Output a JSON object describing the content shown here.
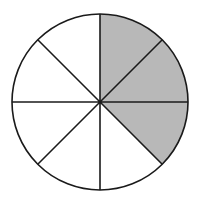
{
  "figure": {
    "background_color": "#ffffff"
  },
  "chart_data": {
    "type": "pie",
    "title": "",
    "subtitle": "",
    "xlabel": "",
    "ylabel": "",
    "legend": [],
    "annotations": [],
    "grid": false,
    "total_sectors": 8,
    "sector_angle_degrees": 45,
    "shaded_sectors": 3,
    "unshaded_sectors": 5,
    "fraction_shaded": "3/8",
    "fraction_unshaded": "5/8",
    "categories": [
      "shaded",
      "unshaded"
    ],
    "values": [
      3,
      5
    ],
    "colors": {
      "shaded": "#b8b8b8",
      "unshaded": "#ffffff",
      "outline": "#1a1a1a"
    },
    "geometry": {
      "center_x": 100,
      "center_y": 102,
      "radius": 88,
      "stroke_width": 1.6
    },
    "sectors": [
      {
        "index": 1,
        "start_deg": 90,
        "end_deg": 45,
        "filled": true,
        "fill": "#b8b8b8"
      },
      {
        "index": 2,
        "start_deg": 45,
        "end_deg": 0,
        "filled": true,
        "fill": "#b8b8b8"
      },
      {
        "index": 3,
        "start_deg": 0,
        "end_deg": -45,
        "filled": true,
        "fill": "#b8b8b8"
      },
      {
        "index": 4,
        "start_deg": -45,
        "end_deg": -90,
        "filled": false,
        "fill": "#ffffff"
      },
      {
        "index": 5,
        "start_deg": -90,
        "end_deg": -135,
        "filled": false,
        "fill": "#ffffff"
      },
      {
        "index": 6,
        "start_deg": -135,
        "end_deg": 180,
        "filled": false,
        "fill": "#ffffff"
      },
      {
        "index": 7,
        "start_deg": 180,
        "end_deg": 135,
        "filled": false,
        "fill": "#ffffff"
      },
      {
        "index": 8,
        "start_deg": 135,
        "end_deg": 90,
        "filled": false,
        "fill": "#ffffff"
      }
    ],
    "divider_lines": [
      {
        "name": "vertical-diameter",
        "angle_deg": 90
      },
      {
        "name": "horizontal-diameter",
        "angle_deg": 0
      },
      {
        "name": "diagonal-diameter-up",
        "angle_deg": 45
      },
      {
        "name": "diagonal-diameter-down",
        "angle_deg": -45
      }
    ]
  }
}
